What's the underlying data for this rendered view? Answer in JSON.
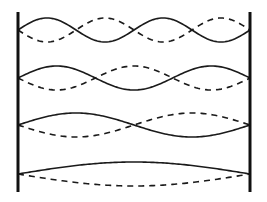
{
  "diagram": {
    "type": "standing-waves-on-string-fixed-ends",
    "width": 267,
    "height": 202,
    "colors": {
      "background": "#ffffff",
      "line": "#1a1a1a",
      "wall": "#111111"
    },
    "walls": {
      "left_x": 18,
      "right_x": 250,
      "top_y": 12,
      "bottom_y": 192
    },
    "modes": [
      {
        "harmonic": 4,
        "loops": 4,
        "center_y": 30,
        "amplitude": 12
      },
      {
        "harmonic": 3,
        "loops": 3,
        "center_y": 78,
        "amplitude": 12
      },
      {
        "harmonic": 2,
        "loops": 2,
        "center_y": 125,
        "amplitude": 12
      },
      {
        "harmonic": 1,
        "loops": 1,
        "center_y": 174,
        "amplitude": 12
      }
    ],
    "legend": {
      "solid": "displacement at one instant",
      "dashed": "displacement half a period later"
    }
  }
}
